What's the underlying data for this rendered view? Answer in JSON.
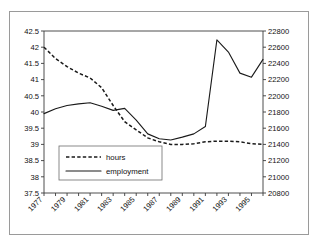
{
  "chart_data": {
    "type": "line",
    "title": "",
    "subtitle": "",
    "xlabel": "",
    "ylabel": "",
    "grid": false,
    "legend_position": "inside-lower-left",
    "x": [
      1977,
      1978,
      1979,
      1980,
      1981,
      1982,
      1983,
      1984,
      1985,
      1986,
      1987,
      1988,
      1989,
      1990,
      1991,
      1992,
      1993,
      1994,
      1995,
      1996
    ],
    "x_tick_labels": [
      "1977",
      "1979",
      "1981",
      "1983",
      "1985",
      "1987",
      "1989",
      "1991",
      "1993",
      "1995"
    ],
    "x_tick_values": [
      1977,
      1979,
      1981,
      1983,
      1985,
      1987,
      1989,
      1991,
      1993,
      1995
    ],
    "xlim": [
      1977,
      1996
    ],
    "left_axis": {
      "label": "",
      "ylim": [
        37.5,
        42.5
      ],
      "tick_step": 0.5,
      "tick_labels": [
        "42.5",
        "42",
        "41.5",
        "41",
        "40.5",
        "40",
        "39.5",
        "39",
        "38.5",
        "38",
        "37.5"
      ],
      "tick_values": [
        42.5,
        42,
        41.5,
        41,
        40.5,
        40,
        39.5,
        39,
        38.5,
        38,
        37.5
      ]
    },
    "right_axis": {
      "label": "",
      "ylim": [
        20800,
        22800
      ],
      "tick_step": 200,
      "tick_labels": [
        "22800",
        "22600",
        "22400",
        "22200",
        "22000",
        "21800",
        "21600",
        "21400",
        "21200",
        "21000",
        "20800"
      ],
      "tick_values": [
        22800,
        22600,
        22400,
        22200,
        22000,
        21800,
        21600,
        21400,
        21200,
        21000,
        20800
      ]
    },
    "series": [
      {
        "name": "hours",
        "axis": "left",
        "style": "dashed",
        "color": "#1a1a1a",
        "values": [
          42.0,
          41.65,
          41.4,
          41.2,
          41.05,
          40.75,
          40.2,
          39.7,
          39.45,
          39.2,
          39.08,
          39.0,
          39.0,
          39.02,
          39.08,
          39.1,
          39.1,
          39.08,
          39.02,
          39.0
        ]
      },
      {
        "name": "employment",
        "axis": "right",
        "style": "solid",
        "color": "#1a1a1a",
        "values": [
          21780,
          21840,
          21880,
          21900,
          21915,
          21870,
          21820,
          21845,
          21700,
          21530,
          21470,
          21455,
          21490,
          21530,
          21620,
          21840,
          22200,
          22580,
          22670,
          22690
        ]
      }
    ],
    "employment_extra": {
      "note": "values continue to 1996",
      "tail_x": [
        1992,
        1993,
        1994,
        1995,
        1996
      ],
      "tail_values": [
        22690,
        22540,
        22280,
        22230,
        22450
      ]
    },
    "legend": [
      {
        "label": "hours",
        "style": "dashed"
      },
      {
        "label": "employment",
        "style": "solid"
      }
    ]
  }
}
